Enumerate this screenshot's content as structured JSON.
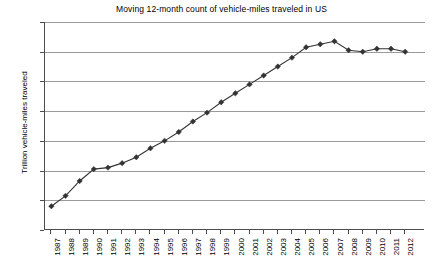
{
  "chart_data": {
    "type": "line",
    "title": "Moving 12-month count of vehicle-miles traveled in US",
    "xlabel": "",
    "ylabel": "Trillion vehicle-miles traveled",
    "ylim": [
      1.7,
      3.1
    ],
    "ytick_labels": [
      "3.1",
      "2.9",
      "2.7",
      "2.5",
      "2.3",
      "2.1",
      "1.9",
      "1.7"
    ],
    "ytick_values": [
      3.1,
      2.9,
      2.7,
      2.5,
      2.3,
      2.1,
      1.9,
      1.7
    ],
    "grid": true,
    "legend": "none",
    "marker": "diamond",
    "line_color": "#333333",
    "grid_color": "#9a9a9a",
    "axis_color": "#4d4d4d",
    "categories": [
      "1987",
      "1988",
      "1989",
      "1990",
      "1991",
      "1992",
      "1993",
      "1994",
      "1995",
      "1996",
      "1997",
      "1998",
      "1999",
      "2000",
      "2001",
      "2002",
      "2003",
      "2004",
      "2005",
      "2006",
      "2007",
      "2008",
      "2009",
      "2010",
      "2011",
      "2012"
    ],
    "values": [
      1.86,
      1.93,
      2.03,
      2.11,
      2.12,
      2.15,
      2.19,
      2.25,
      2.3,
      2.36,
      2.43,
      2.49,
      2.56,
      2.62,
      2.68,
      2.74,
      2.8,
      2.86,
      2.93,
      2.95,
      2.97,
      2.91,
      2.9,
      2.92,
      2.92,
      2.9
    ],
    "series": [
      {
        "name": "Moving 12-month count of vehicle-miles traveled in US",
        "values": [
          1.86,
          1.93,
          2.03,
          2.11,
          2.12,
          2.15,
          2.19,
          2.25,
          2.3,
          2.36,
          2.43,
          2.49,
          2.56,
          2.62,
          2.68,
          2.74,
          2.8,
          2.86,
          2.93,
          2.95,
          2.97,
          2.91,
          2.9,
          2.92,
          2.92,
          2.9
        ]
      }
    ]
  }
}
